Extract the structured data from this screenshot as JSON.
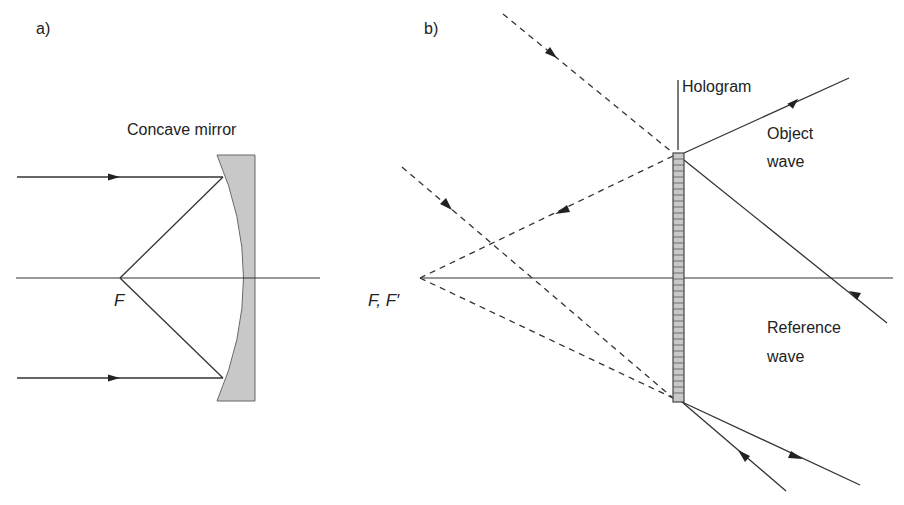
{
  "panels": {
    "a": {
      "label": "a)",
      "mirror_label": "Concave mirror",
      "focus_label": "F",
      "colors": {
        "mirror_fill": "#c8c8c8",
        "line": "#333333"
      }
    },
    "b": {
      "label": "b)",
      "hologram_label": "Hologram",
      "object_wave_label_line1": "Object",
      "object_wave_label_line2": "wave",
      "reference_wave_label_line1": "Reference",
      "reference_wave_label_line2": "wave",
      "focus_label": "F, F′",
      "colors": {
        "plate_fill": "#c8c8c8",
        "line": "#333333"
      }
    }
  }
}
